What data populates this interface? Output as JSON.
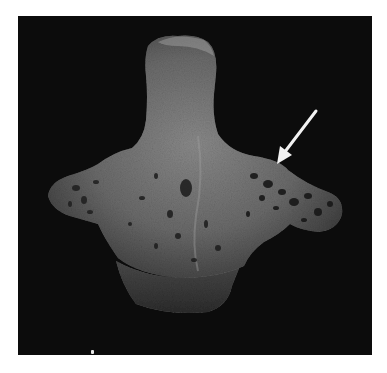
{
  "figure": {
    "background_color": "#0c0c0c",
    "bone_color": "#6e6e6e",
    "annotation": {
      "type": "arrow",
      "color": "#f2f2f2",
      "direction": "down-left",
      "points_to": "right lateral mass with porous/pitted surface"
    }
  }
}
